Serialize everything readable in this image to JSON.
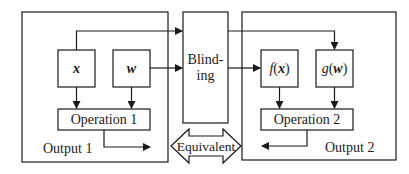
{
  "diagram": {
    "left_panel": {
      "output_label": "Output 1",
      "input_x": "x",
      "input_w": "w",
      "operation": "Operation 1"
    },
    "blinding": {
      "line1": "Blind-",
      "line2": "ing"
    },
    "right_panel": {
      "output_label": "Output 2",
      "fx_func": "f",
      "fx_open": "(",
      "fx_arg": "x",
      "fx_close": ")",
      "gw_func": "g",
      "gw_open": "(",
      "gw_arg": "w",
      "gw_close": ")",
      "operation": "Operation 2"
    },
    "equivalence": {
      "label": "Equivalent"
    },
    "colors": {
      "stroke": "#1a1a1a",
      "background": "#ffffff"
    }
  }
}
